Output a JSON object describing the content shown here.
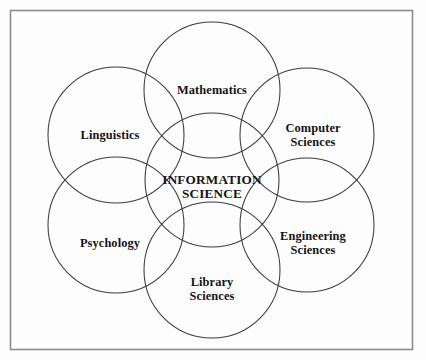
{
  "figure": {
    "type": "venn-diagram",
    "title_text": "INFORMATION SCIENCE",
    "border_color": "#8d8d93",
    "circle_stroke_color": "#3a3a44",
    "background_color": "#fdfdfd",
    "text_color": "#15131a"
  },
  "center": {
    "name": "information-science",
    "label": "INFORMATION\nSCIENCE",
    "cx": 212,
    "cy": 180,
    "r": 67
  },
  "disciplines": [
    {
      "name": "mathematics",
      "label": "Mathematics",
      "position": "top",
      "cx": 212,
      "cy": 90,
      "r": 68,
      "label_x": 212,
      "label_y": 84
    },
    {
      "name": "computer-sciences",
      "label": "Computer\nSciences",
      "position": "upper-right",
      "cx": 307,
      "cy": 135,
      "r": 67,
      "label_x": 313,
      "label_y": 129
    },
    {
      "name": "engineering-sciences",
      "label": "Engineering\nSciences",
      "position": "lower-right",
      "cx": 307,
      "cy": 225,
      "r": 67,
      "label_x": 313,
      "label_y": 237
    },
    {
      "name": "library-sciences",
      "label": "Library\nSciences",
      "position": "bottom",
      "cx": 212,
      "cy": 270,
      "r": 68,
      "label_x": 212,
      "label_y": 283
    },
    {
      "name": "psychology",
      "label": "Psychology",
      "position": "lower-left",
      "cx": 116,
      "cy": 225,
      "r": 68,
      "label_x": 110,
      "label_y": 237
    },
    {
      "name": "linguistics",
      "label": "Linguistics",
      "position": "upper-left",
      "cx": 116,
      "cy": 135,
      "r": 68,
      "label_x": 110,
      "label_y": 129
    }
  ],
  "border": {
    "x": 10,
    "y": 10,
    "width": 403,
    "height": 340
  }
}
